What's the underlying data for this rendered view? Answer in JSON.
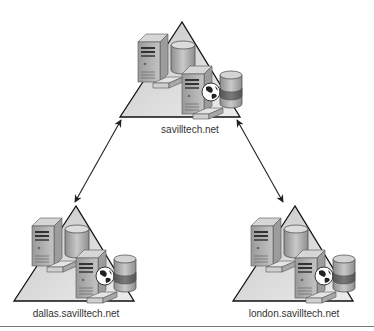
{
  "diagram": {
    "type": "domain-tree",
    "nodes": [
      {
        "id": "root",
        "label": "savilltech.net",
        "role": "forest root domain"
      },
      {
        "id": "dallas",
        "label": "dallas.savilltech.net",
        "role": "child domain"
      },
      {
        "id": "london",
        "label": "london.savilltech.net",
        "role": "child domain"
      }
    ],
    "edges": [
      {
        "from": "root",
        "to": "dallas",
        "style": "double-arrow"
      },
      {
        "from": "root",
        "to": "london",
        "style": "double-arrow"
      }
    ],
    "icons": [
      "server-icon",
      "database-cylinder-icon",
      "globe-icon",
      "keyboard-icon",
      "triangle-domain-icon"
    ],
    "colors": {
      "triangle_fill": "#d9d9d9",
      "server_body": "#b5b5b5",
      "cylinder_top": "#c8c8c8",
      "cylinder_band": "#707070",
      "line": "#222222"
    }
  }
}
